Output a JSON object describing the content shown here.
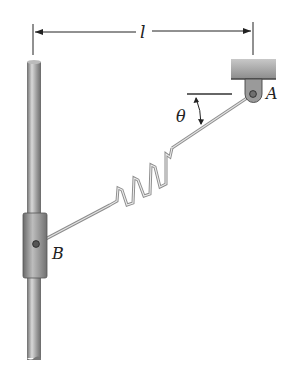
{
  "diagram": {
    "labels": {
      "length": "l",
      "point_a": "A",
      "point_b": "B",
      "angle": "θ"
    },
    "elements": [
      "vertical-rod",
      "sliding-collar",
      "fixed-support-bracket",
      "pin-joint-a",
      "pin-joint-b",
      "spring",
      "link-rod",
      "dimension-line",
      "angle-arc"
    ],
    "colors": {
      "rod": "#9a9a9a",
      "collar": "#8a8a8a",
      "bracket": "#a8a8a8",
      "line": "#333333",
      "spring": "#b0b0b0"
    }
  }
}
